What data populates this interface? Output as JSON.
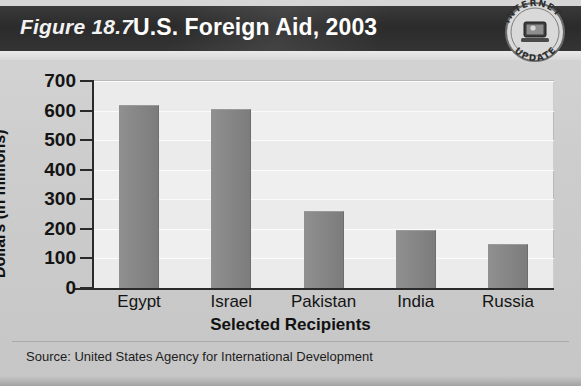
{
  "figure": {
    "number_label": "Figure 18.7",
    "title": "U.S. Foreign Aid, 2003",
    "source": "Source:  United States Agency for International Development",
    "badge": {
      "line1": "INTERNET",
      "line2": "UPDATE",
      "icon": "computer-icon"
    }
  },
  "chart_data": {
    "type": "bar",
    "title": "U.S. Foreign Aid, 2003",
    "categories": [
      "Egypt",
      "Israel",
      "Pakistan",
      "India",
      "Russia"
    ],
    "values": [
      620,
      605,
      260,
      195,
      150
    ],
    "xlabel": "Selected Recipients",
    "ylabel": "Dollars (in millions)",
    "ylim": [
      0,
      700
    ],
    "yticks": [
      0,
      100,
      200,
      300,
      400,
      500,
      600,
      700
    ],
    "ytick_labels": [
      "0",
      "100",
      "200",
      "300",
      "400",
      "500",
      "600",
      "700"
    ],
    "grid": true,
    "legend": "none",
    "bar_color": "#858585",
    "plot_background": "#efefef",
    "banner_color": "#303030"
  }
}
